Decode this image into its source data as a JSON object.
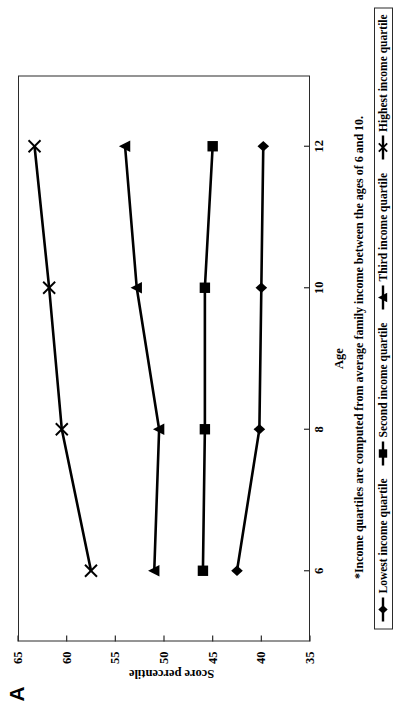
{
  "panel": {
    "letter": "A"
  },
  "axes": {
    "x_title": "Age",
    "y_title": "Score percentile",
    "x_ticks": [
      "6",
      "8",
      "10",
      "12"
    ],
    "y_ticks": [
      "65",
      "60",
      "55",
      "50",
      "45",
      "40",
      "35"
    ]
  },
  "footnote": "*Income quartiles are computed from average family income between the ages of 6 and 10.",
  "legend": {
    "entries": [
      {
        "label": "Lowest income quartile",
        "marker": "diamond-marker-icon"
      },
      {
        "label": "Second income quartile",
        "marker": "square-marker-icon"
      },
      {
        "label": "Third income quartile",
        "marker": "triangle-marker-icon"
      },
      {
        "label": "Highest income quartile",
        "marker": "x-marker-icon"
      }
    ]
  },
  "colors": {
    "line": "#000000",
    "frame": "#2b2b2b",
    "background": "#ffffff"
  },
  "chart_data": {
    "type": "line",
    "title": "",
    "xlabel": "Age",
    "ylabel": "Score percentile",
    "x": [
      6,
      8,
      10,
      12
    ],
    "xlim": [
      5,
      13
    ],
    "ylim": [
      35,
      65
    ],
    "ytick_step": 5,
    "grid": false,
    "legend_position": "bottom",
    "series": [
      {
        "name": "Lowest income quartile",
        "marker": "diamond",
        "values": [
          42.5,
          40.2,
          40.0,
          39.8
        ]
      },
      {
        "name": "Second income quartile",
        "marker": "square",
        "values": [
          46.0,
          45.8,
          45.8,
          45.0
        ]
      },
      {
        "name": "Third income quartile",
        "marker": "triangle",
        "values": [
          51.0,
          50.5,
          52.8,
          54.0
        ]
      },
      {
        "name": "Highest income quartile",
        "marker": "x",
        "values": [
          57.5,
          60.5,
          61.8,
          63.3
        ]
      }
    ]
  }
}
